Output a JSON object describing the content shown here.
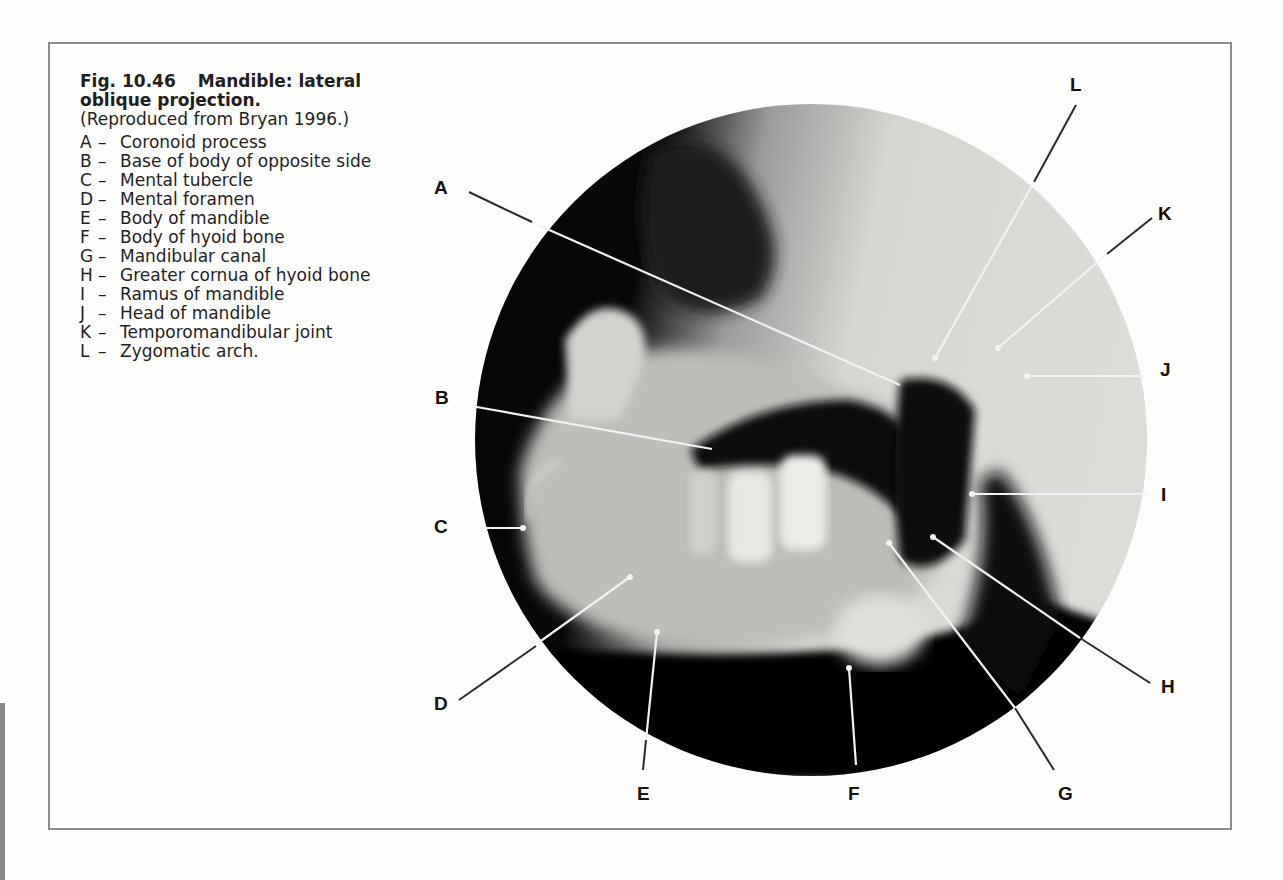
{
  "caption": {
    "figure_number": "Fig. 10.46",
    "title": "Mandible: lateral oblique projection.",
    "credit": "(Reproduced from Bryan 1996.)"
  },
  "legend": [
    {
      "key": "A",
      "text": "Coronoid process"
    },
    {
      "key": "B",
      "text": "Base of body of opposite side"
    },
    {
      "key": "C",
      "text": "Mental tubercle"
    },
    {
      "key": "D",
      "text": "Mental foramen"
    },
    {
      "key": "E",
      "text": "Body of mandible"
    },
    {
      "key": "F",
      "text": "Body of hyoid bone"
    },
    {
      "key": "G",
      "text": "Mandibular canal"
    },
    {
      "key": "H",
      "text": "Greater cornua of hyoid bone"
    },
    {
      "key": "I",
      "text": "Ramus of mandible"
    },
    {
      "key": "J",
      "text": "Head of mandible"
    },
    {
      "key": "K",
      "text": "Temporomandibular joint"
    },
    {
      "key": "L",
      "text": "Zygomatic arch."
    }
  ],
  "dash": "–",
  "labels": {
    "A": "A",
    "B": "B",
    "C": "C",
    "D": "D",
    "E": "E",
    "F": "F",
    "G": "G",
    "H": "H",
    "I": "I",
    "J": "J",
    "K": "K",
    "L": "L"
  },
  "colors": {
    "frame": "#8c8c8c",
    "xray_dark": "#050505",
    "xray_light": "#d9d9d6",
    "leader_outside": "#2a2a2a",
    "leader_inside": "#f2f2f2"
  }
}
